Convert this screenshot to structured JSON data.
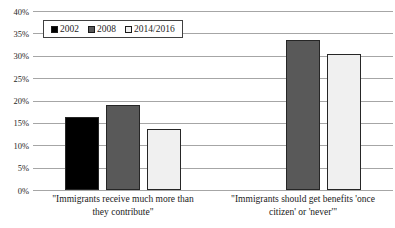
{
  "chart_data": {
    "type": "bar",
    "title": "",
    "xlabel": "",
    "ylabel": "",
    "ylim": [
      0,
      40
    ],
    "ytick_step": 5,
    "ytick_labels": [
      "0%",
      "5%",
      "10%",
      "15%",
      "20%",
      "25%",
      "30%",
      "35%",
      "40%"
    ],
    "grid": true,
    "legend_position": "top-left-inside",
    "categories": [
      "\"Immigrants receive much more than they contribute\"",
      "\"Immigrants should get benefits 'once citizen' or 'never'\""
    ],
    "series": [
      {
        "name": "2002",
        "color": "#000000",
        "values": [
          16.3,
          null
        ]
      },
      {
        "name": "2008",
        "color": "#595959",
        "values": [
          19.0,
          33.5
        ]
      },
      {
        "name": "2014/2016",
        "color": "#f0f0f0",
        "values": [
          13.7,
          30.4
        ]
      }
    ],
    "colors": {
      "gridline": "#a6a6a6",
      "bar_border": "#262626",
      "text": "#1f1f1f",
      "background": "#ffffff"
    }
  }
}
